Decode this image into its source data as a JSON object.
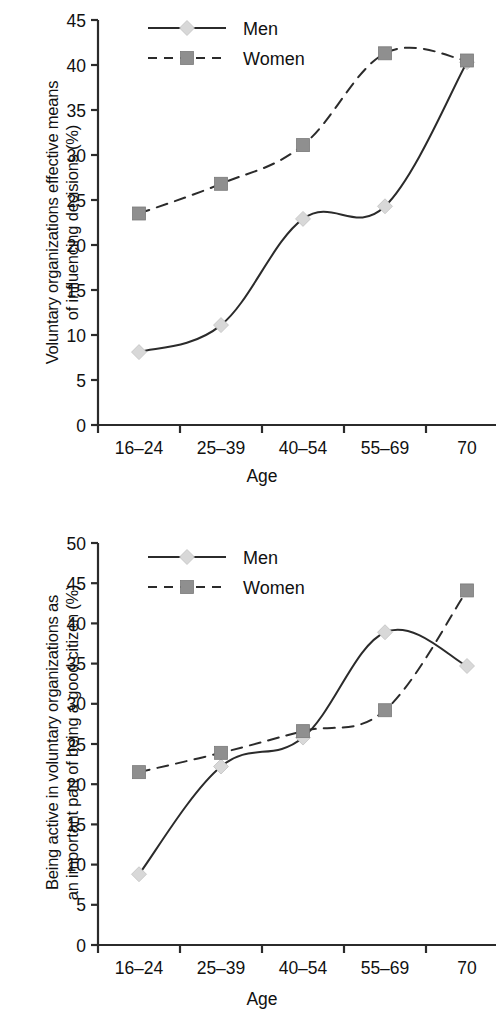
{
  "figure": {
    "background": "#ffffff",
    "line_color": "#2b2b2b",
    "men_marker_color": "#d8d8d8",
    "women_marker_color": "#8f8f8f"
  },
  "charts": [
    {
      "id": "chart-top",
      "type": "line",
      "title": "",
      "ylabel_line1": "Voluntary organizations effective means",
      "ylabel_line2": "of influencing decisions (%)",
      "xlabel": "Age",
      "categories": [
        "16–24",
        "25–39",
        "40–54",
        "55–69",
        "70"
      ],
      "ylim": [
        0,
        45
      ],
      "yticks": [
        0,
        5,
        10,
        15,
        20,
        25,
        30,
        35,
        40,
        45
      ],
      "ytick_labels": [
        "0",
        "5",
        "10",
        "15",
        "20",
        "25",
        "30",
        "35",
        "40",
        "45"
      ],
      "grid": false,
      "legend_position": "top-center",
      "series": [
        {
          "name": "Men",
          "style": "solid",
          "marker": "diamond",
          "values": [
            8.1,
            11.1,
            22.9,
            24.3,
            40.3
          ]
        },
        {
          "name": "Women",
          "style": "dashed",
          "marker": "square",
          "values": [
            23.5,
            26.8,
            31.1,
            41.3,
            40.5
          ]
        }
      ]
    },
    {
      "id": "chart-bottom",
      "type": "line",
      "title": "",
      "ylabel_line1": "Being active in voluntary organizations as",
      "ylabel_line2": "an important part of being a good citizen (%)",
      "xlabel": "Age",
      "categories": [
        "16–24",
        "25–39",
        "40–54",
        "55–69",
        "70"
      ],
      "ylim": [
        0,
        50
      ],
      "yticks": [
        0,
        5,
        10,
        15,
        20,
        25,
        30,
        35,
        40,
        45,
        50
      ],
      "ytick_labels": [
        "0",
        "5",
        "10",
        "15",
        "20",
        "25",
        "30",
        "35",
        "40",
        "45",
        "50"
      ],
      "grid": false,
      "legend_position": "top-center",
      "series": [
        {
          "name": "Men",
          "style": "solid",
          "marker": "diamond",
          "values": [
            8.8,
            22.2,
            25.8,
            38.9,
            34.7
          ]
        },
        {
          "name": "Women",
          "style": "dashed",
          "marker": "square",
          "values": [
            21.5,
            23.9,
            26.6,
            29.2,
            44.1
          ]
        }
      ]
    }
  ],
  "chart_data": [
    {
      "type": "line",
      "title": "Voluntary organizations effective means of influencing decisions (%)",
      "xlabel": "Age",
      "ylabel": "Voluntary organizations effective means of influencing decisions (%)",
      "categories": [
        "16–24",
        "25–39",
        "40–54",
        "55–69",
        "70"
      ],
      "ylim": [
        0,
        45
      ],
      "yticks": [
        0,
        5,
        10,
        15,
        20,
        25,
        30,
        35,
        40,
        45
      ],
      "grid": false,
      "legend": [
        "Men",
        "Women"
      ],
      "legend_position": "top-center",
      "series": [
        {
          "name": "Men",
          "values": [
            8.1,
            11.1,
            22.9,
            24.3,
            40.3
          ]
        },
        {
          "name": "Women",
          "values": [
            23.5,
            26.8,
            31.1,
            41.3,
            40.5
          ]
        }
      ]
    },
    {
      "type": "line",
      "title": "Being active in voluntary organizations as an important part of being a good citizen (%)",
      "xlabel": "Age",
      "ylabel": "Being active in voluntary organizations as an important part of being a good citizen (%)",
      "categories": [
        "16–24",
        "25–39",
        "40–54",
        "55–69",
        "70"
      ],
      "ylim": [
        0,
        50
      ],
      "yticks": [
        0,
        5,
        10,
        15,
        20,
        25,
        30,
        35,
        40,
        45,
        50
      ],
      "grid": false,
      "legend": [
        "Men",
        "Women"
      ],
      "legend_position": "top-center",
      "series": [
        {
          "name": "Men",
          "values": [
            8.8,
            22.2,
            25.8,
            38.9,
            34.7
          ]
        },
        {
          "name": "Women",
          "values": [
            21.5,
            23.9,
            26.6,
            29.2,
            44.1
          ]
        }
      ]
    }
  ]
}
